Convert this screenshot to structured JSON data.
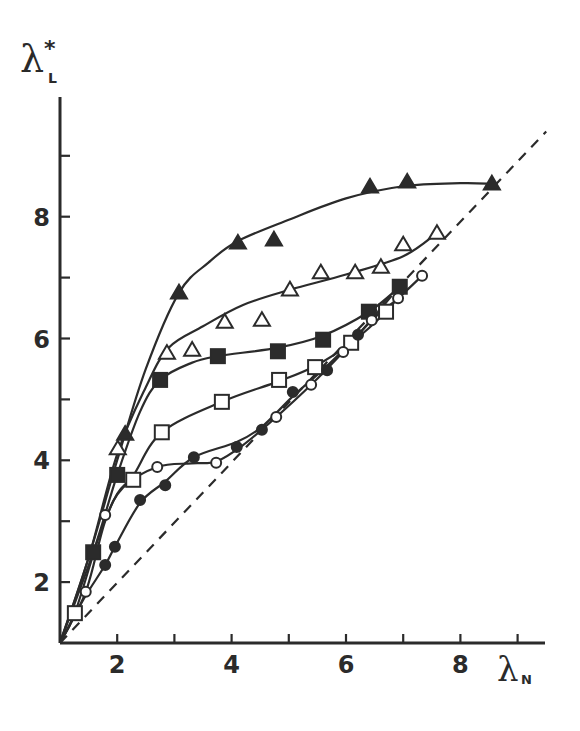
{
  "chart_data": {
    "type": "scatter",
    "title": "",
    "xlabel": "λN",
    "ylabel": "λL*",
    "xlabel_main": "λ",
    "xlabel_sub": "N",
    "ylabel_main": "λ",
    "ylabel_sub": "L",
    "ylabel_sup": "*",
    "xlim": [
      1,
      9.5
    ],
    "ylim": [
      1,
      9.6
    ],
    "x_ticks": [
      2,
      3,
      4,
      5,
      6,
      7,
      8,
      9
    ],
    "x_tick_labels": [
      "2",
      "",
      "4",
      "",
      "6",
      "",
      "8",
      ""
    ],
    "y_ticks": [
      2,
      3,
      4,
      5,
      6,
      7,
      8,
      9
    ],
    "y_tick_labels": [
      "2",
      "",
      "4",
      "",
      "6",
      "",
      "8",
      ""
    ],
    "grid": false,
    "legend": "none",
    "reference_line": {
      "label": "λL* = λN",
      "style": "dashed",
      "from": [
        1,
        1
      ],
      "to": [
        9.5,
        9.4
      ]
    },
    "series": [
      {
        "name": "filled-triangles",
        "marker": "filled-triangle",
        "x": [
          2.14,
          3.08,
          4.11,
          4.74,
          6.42,
          7.07,
          8.55
        ],
        "y": [
          4.43,
          6.75,
          7.57,
          7.62,
          8.49,
          8.57,
          8.54
        ],
        "curve": [
          [
            1,
            1
          ],
          [
            1.5,
            2.4
          ],
          [
            2.0,
            4.0
          ],
          [
            2.5,
            5.5
          ],
          [
            3.08,
            6.75
          ],
          [
            3.6,
            7.25
          ],
          [
            4.11,
            7.6
          ],
          [
            5,
            7.95
          ],
          [
            6,
            8.3
          ],
          [
            7,
            8.5
          ],
          [
            8,
            8.55
          ],
          [
            8.55,
            8.54
          ]
        ]
      },
      {
        "name": "open-triangles",
        "marker": "open-triangle",
        "x": [
          2.01,
          2.87,
          3.31,
          3.88,
          4.53,
          5.02,
          5.56,
          6.16,
          6.61,
          7.0,
          7.59
        ],
        "y": [
          4.19,
          5.76,
          5.81,
          6.27,
          6.3,
          6.8,
          7.08,
          7.08,
          7.17,
          7.54,
          7.73
        ],
        "curve": [
          [
            1,
            1
          ],
          [
            1.5,
            2.4
          ],
          [
            2.0,
            4.1
          ],
          [
            2.5,
            5.2
          ],
          [
            2.9,
            5.85
          ],
          [
            3.5,
            6.2
          ],
          [
            4.2,
            6.55
          ],
          [
            5.02,
            6.8
          ],
          [
            6,
            7.05
          ],
          [
            7,
            7.35
          ],
          [
            7.59,
            7.73
          ]
        ]
      },
      {
        "name": "filled-squares",
        "marker": "filled-square",
        "x": [
          1.58,
          2.0,
          2.75,
          3.76,
          4.81,
          5.6,
          6.4,
          6.94
        ],
        "y": [
          2.49,
          3.76,
          5.32,
          5.71,
          5.79,
          5.98,
          6.44,
          6.85
        ],
        "curve": [
          [
            1,
            1
          ],
          [
            1.58,
            2.49
          ],
          [
            2.0,
            3.76
          ],
          [
            2.4,
            4.8
          ],
          [
            2.75,
            5.32
          ],
          [
            3.3,
            5.6
          ],
          [
            3.76,
            5.71
          ],
          [
            4.81,
            5.85
          ],
          [
            5.6,
            6.05
          ],
          [
            6.4,
            6.44
          ],
          [
            6.94,
            6.85
          ]
        ]
      },
      {
        "name": "open-squares",
        "marker": "open-square",
        "x": [
          1.26,
          2.28,
          2.78,
          3.83,
          4.83,
          5.46,
          6.09,
          6.7
        ],
        "y": [
          1.49,
          3.68,
          4.46,
          4.96,
          5.32,
          5.53,
          5.93,
          6.44
        ],
        "curve": [
          [
            1,
            1
          ],
          [
            1.26,
            1.49
          ],
          [
            1.7,
            2.8
          ],
          [
            2.0,
            3.45
          ],
          [
            2.28,
            3.75
          ],
          [
            2.78,
            4.46
          ],
          [
            3.83,
            4.96
          ],
          [
            4.83,
            5.3
          ],
          [
            5.46,
            5.55
          ],
          [
            6.09,
            5.93
          ],
          [
            6.7,
            6.44
          ],
          [
            7.0,
            6.8
          ]
        ]
      },
      {
        "name": "open-circles",
        "marker": "open-circle",
        "x": [
          1.45,
          1.79,
          2.7,
          3.73,
          4.78,
          5.39,
          5.95,
          6.45,
          6.91,
          7.33
        ],
        "y": [
          1.84,
          3.1,
          3.89,
          3.96,
          4.71,
          5.24,
          5.78,
          6.3,
          6.66,
          7.03
        ],
        "curve": [
          [
            1,
            1
          ],
          [
            1.45,
            1.84
          ],
          [
            1.79,
            3.0
          ],
          [
            2.1,
            3.55
          ],
          [
            2.7,
            3.89
          ],
          [
            3.3,
            3.95
          ],
          [
            3.73,
            3.98
          ],
          [
            4.2,
            4.25
          ],
          [
            4.78,
            4.71
          ],
          [
            5.39,
            5.24
          ],
          [
            5.95,
            5.78
          ],
          [
            6.45,
            6.3
          ],
          [
            6.91,
            6.66
          ],
          [
            7.33,
            7.03
          ]
        ]
      },
      {
        "name": "filled-circles",
        "marker": "filled-circle",
        "x": [
          1.79,
          1.96,
          2.4,
          2.84,
          3.34,
          4.09,
          4.53,
          5.07,
          5.67,
          6.21
        ],
        "y": [
          2.28,
          2.58,
          3.35,
          3.59,
          4.05,
          4.22,
          4.5,
          5.12,
          5.48,
          6.06
        ],
        "curve": [
          [
            1,
            1
          ],
          [
            1.4,
            1.7
          ],
          [
            1.79,
            2.28
          ],
          [
            1.96,
            2.58
          ],
          [
            2.4,
            3.3
          ],
          [
            2.84,
            3.65
          ],
          [
            3.34,
            4.05
          ],
          [
            4.09,
            4.3
          ],
          [
            4.53,
            4.55
          ],
          [
            5.07,
            5.05
          ],
          [
            5.67,
            5.55
          ],
          [
            6.21,
            6.06
          ],
          [
            6.8,
            6.7
          ]
        ]
      }
    ]
  }
}
